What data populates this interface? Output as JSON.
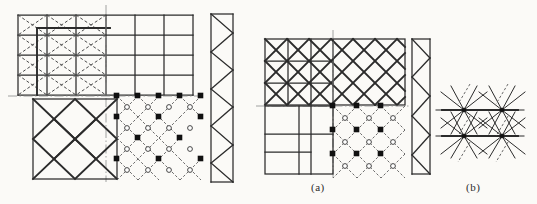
{
  "figure": {
    "background_color": "#fbfaf7",
    "line_color": "#2b2b2b",
    "dashed_color": "#555555",
    "centerline_color": "#777777",
    "width": 537,
    "height": 204,
    "labels": [
      {
        "id": "a",
        "text": "(a)",
        "x": 311,
        "y": 181
      },
      {
        "id": "b",
        "text": "(b)",
        "x": 466,
        "y": 181
      }
    ]
  },
  "panels": [
    {
      "id": "panel-left",
      "name": "left-scheme",
      "description": "Two-way orthogonal grid elevation over diamond-lattice plan",
      "elevation": {
        "x": 18,
        "y": 14,
        "width": 175,
        "height": 82,
        "columns": 6,
        "rows": 4,
        "braced_bays_left": 3,
        "bracing_style": "dashed-cross"
      },
      "plan": {
        "x": 18,
        "y": 98,
        "width": 175,
        "height": 84,
        "solid_half": {
          "x": 18,
          "y": 98,
          "width": 88,
          "height": 84,
          "pattern": "rotated-square-lattice"
        },
        "dashed_half": {
          "x": 106,
          "y": 98,
          "width": 87,
          "height": 84,
          "pattern": "diagonal-node-grid"
        }
      },
      "truss": {
        "x": 205,
        "y": 14,
        "width": 28,
        "height": 168,
        "type": "warren-vertical",
        "panels": 9
      }
    },
    {
      "id": "panel-a",
      "name": "scheme-a",
      "description": "Diagonal lattice elevation over orthogonal plan with node grid",
      "elevation": {
        "x": 265,
        "y": 38,
        "width": 140,
        "height": 66,
        "columns": 6,
        "rows": 3,
        "bracing_style": "solid-diagonal-lattice"
      },
      "plan": {
        "x": 265,
        "y": 106,
        "width": 140,
        "height": 68,
        "solid_half": {
          "x": 265,
          "y": 106,
          "width": 68,
          "height": 68,
          "pattern": "orthogonal-grid"
        },
        "dashed_half": {
          "x": 333,
          "y": 106,
          "width": 72,
          "height": 68,
          "pattern": "diagonal-node-grid"
        }
      },
      "truss": {
        "x": 408,
        "y": 38,
        "width": 22,
        "height": 136,
        "type": "warren-vertical",
        "panels": 7
      }
    },
    {
      "id": "panel-b",
      "name": "scheme-b",
      "description": "Joint detail: radiating members converging at nodes",
      "detail": {
        "x": 436,
        "y": 84,
        "width": 82,
        "height": 72,
        "cells_x": 2,
        "cells_y": 2,
        "rays_per_node": 8
      }
    }
  ],
  "nodes": {
    "filled_marker": "filled-square",
    "hollow_marker": "hollow-circle",
    "filled_color": "#111111",
    "hollow_color": "#ffffff"
  }
}
